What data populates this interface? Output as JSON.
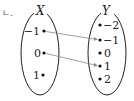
{
  "choice_label": "ㄴ.",
  "domain_set": {
    "name": "X",
    "elements": [
      "−1",
      "0",
      "1"
    ]
  },
  "codomain_set": {
    "name": "Y",
    "elements": [
      "−2",
      "−1",
      "0",
      "1",
      "2"
    ]
  },
  "mappings": [
    {
      "from": "−1",
      "to": "−1"
    },
    {
      "from": "0",
      "to": "1"
    }
  ],
  "colors": {
    "ellipse_stroke": "#222222",
    "arrow": "#888888",
    "text": "#222222"
  }
}
